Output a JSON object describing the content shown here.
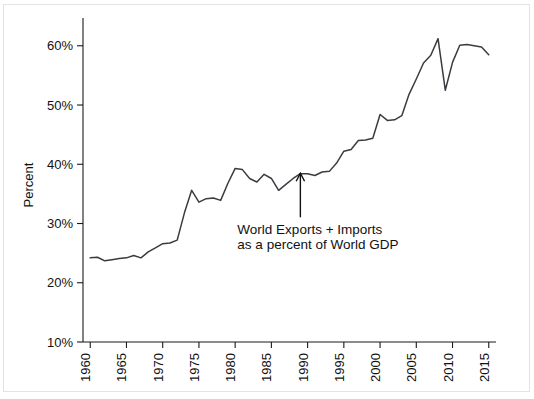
{
  "chart_data": {
    "type": "line",
    "title": "",
    "xlabel": "",
    "ylabel": "Percent",
    "xlim": [
      1959,
      2016
    ],
    "ylim": [
      10,
      63
    ],
    "grid": false,
    "legend": "none",
    "y_tick_labels": [
      "10%",
      "20%",
      "30%",
      "40%",
      "50%",
      "60%"
    ],
    "y_ticks": [
      10,
      20,
      30,
      40,
      50,
      60
    ],
    "x_tick_labels": [
      "1960",
      "1965",
      "1970",
      "1975",
      "1980",
      "1985",
      "1990",
      "1995",
      "2000",
      "2005",
      "2010",
      "2015"
    ],
    "x_ticks": [
      1960,
      1965,
      1970,
      1975,
      1980,
      1985,
      1990,
      1995,
      2000,
      2005,
      2010,
      2015
    ],
    "annotations": [
      {
        "line1": "World Exports + Imports",
        "line2": "as a percent of World GDP",
        "points_to_year": 1989,
        "points_to_value": 37.8
      }
    ],
    "series": [
      {
        "name": "World Exports + Imports as a percent of World GDP",
        "color": "#3b3b42",
        "x": [
          1960,
          1961,
          1962,
          1963,
          1964,
          1965,
          1966,
          1967,
          1968,
          1969,
          1970,
          1971,
          1972,
          1973,
          1974,
          1975,
          1976,
          1977,
          1978,
          1979,
          1980,
          1981,
          1982,
          1983,
          1984,
          1985,
          1986,
          1987,
          1988,
          1989,
          1990,
          1991,
          1992,
          1993,
          1994,
          1995,
          1996,
          1997,
          1998,
          1999,
          2000,
          2001,
          2002,
          2003,
          2004,
          2005,
          2006,
          2007,
          2008,
          2009,
          2010,
          2011,
          2012,
          2013,
          2014,
          2015
        ],
        "values": [
          24.2,
          24.3,
          23.7,
          23.9,
          24.1,
          24.2,
          24.6,
          24.2,
          25.2,
          25.9,
          26.6,
          26.7,
          27.2,
          31.8,
          35.6,
          33.6,
          34.2,
          34.3,
          33.9,
          36.8,
          39.3,
          39.1,
          37.6,
          37.0,
          38.3,
          37.6,
          35.6,
          36.6,
          37.6,
          38.4,
          38.4,
          38.1,
          38.7,
          38.8,
          40.2,
          42.2,
          42.5,
          44.0,
          44.1,
          44.4,
          48.4,
          47.4,
          47.5,
          48.2,
          51.8,
          54.4,
          57.1,
          58.4,
          61.2,
          52.5,
          57.2,
          60.1,
          60.2,
          60.0,
          59.8,
          58.5
        ]
      }
    ]
  }
}
